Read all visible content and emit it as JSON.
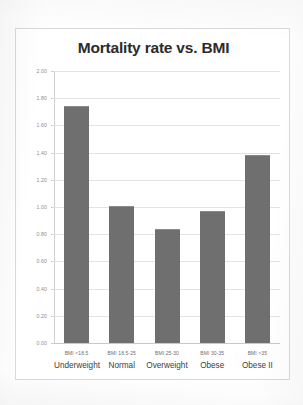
{
  "chart_data": {
    "type": "bar",
    "title": "Mortality rate vs. BMI",
    "xlabel": "",
    "ylabel": "",
    "ylim": [
      0.0,
      2.0
    ],
    "ytick_step": 0.2,
    "grid": true,
    "legend": "none",
    "bar_color": "#6f6f6f",
    "categories": [
      "Underweight",
      "Normal",
      "Overweight",
      "Obese",
      "Obese II"
    ],
    "category_codes": [
      "BMI <18.5",
      "BMI 18.5-25",
      "BMI 25-30",
      "BMI 30-35",
      "BMI >35"
    ],
    "values": [
      1.74,
      1.01,
      0.84,
      0.97,
      1.38
    ],
    "ytick_labels": [
      "2.00",
      "1.80",
      "1.60",
      "1.40",
      "1.20",
      "1.00",
      "0.80",
      "0.60",
      "0.40",
      "0.20",
      "0.00"
    ]
  }
}
